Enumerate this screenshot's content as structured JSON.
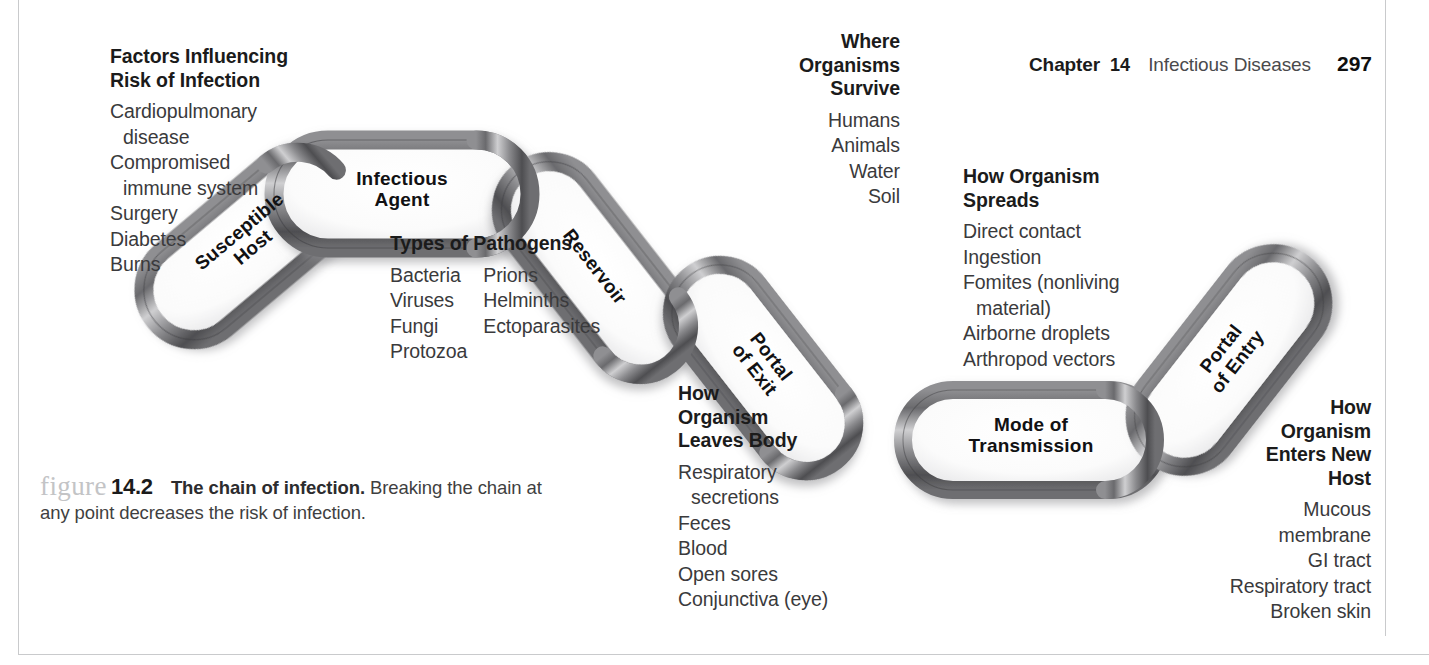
{
  "running_head": {
    "chapter_word": "Chapter",
    "chapter_number": "14",
    "chapter_title": "Infectious Diseases",
    "page_number": "297"
  },
  "caption": {
    "figure_word": "figure",
    "figure_number": "14.2",
    "lead": "The chain of infection.",
    "rest": " Breaking the chain at any point decreases the risk of infection."
  },
  "chain": {
    "links": [
      {
        "label": "Susceptible\nHost"
      },
      {
        "label": "Infectious\nAgent"
      },
      {
        "label": "Reservoir"
      },
      {
        "label": "Portal\nof Exit"
      },
      {
        "label": "Mode of\nTransmission"
      },
      {
        "label": "Portal\nof Entry"
      }
    ]
  },
  "blocks": {
    "susceptible_host": {
      "heading": "Factors Influencing\nRisk of Infection",
      "items": [
        {
          "text": "Cardiopulmonary",
          "indent": false
        },
        {
          "text": "disease",
          "indent": true
        },
        {
          "text": "Compromised",
          "indent": false
        },
        {
          "text": "immune system",
          "indent": true
        },
        {
          "text": "Surgery",
          "indent": false
        },
        {
          "text": "Diabetes",
          "indent": false
        },
        {
          "text": "Burns",
          "indent": false
        }
      ]
    },
    "pathogens": {
      "heading": "Types of Pathogens",
      "column_left": [
        "Bacteria",
        "Viruses",
        "Fungi",
        "Protozoa"
      ],
      "column_right": [
        "Prions",
        "Helminths",
        "Ectoparasites"
      ]
    },
    "reservoir": {
      "heading": "Where\nOrganisms\nSurvive",
      "items": [
        "Humans",
        "Animals",
        "Water",
        "Soil"
      ]
    },
    "mode_of_transmission": {
      "heading": "How Organism\nSpreads",
      "items": [
        {
          "text": "Direct contact",
          "indent": false
        },
        {
          "text": "Ingestion",
          "indent": false
        },
        {
          "text": "Fomites (nonliving",
          "indent": false
        },
        {
          "text": "material)",
          "indent": true
        },
        {
          "text": "Airborne droplets",
          "indent": false
        },
        {
          "text": "Arthropod vectors",
          "indent": false
        }
      ]
    },
    "portal_of_exit": {
      "heading": "How\nOrganism\nLeaves Body",
      "items": [
        {
          "text": "Respiratory",
          "indent": false
        },
        {
          "text": "secretions",
          "indent": true
        },
        {
          "text": "Feces",
          "indent": false
        },
        {
          "text": "Blood",
          "indent": false
        },
        {
          "text": "Open sores",
          "indent": false
        },
        {
          "text": "Conjunctiva (eye)",
          "indent": false
        }
      ]
    },
    "portal_of_entry": {
      "heading": "How\nOrganism\nEnters New\nHost",
      "items": [
        "Mucous",
        "membrane",
        "GI tract",
        "Respiratory tract",
        "Broken skin"
      ]
    }
  },
  "colors": {
    "chain_dark": "#4a4a4c",
    "chain_mid": "#7d7d80",
    "chain_light": "#d4d4d6",
    "text_dark": "#1b1b1b",
    "text_body": "#3a3a3c",
    "rule": "#c9cacc"
  }
}
